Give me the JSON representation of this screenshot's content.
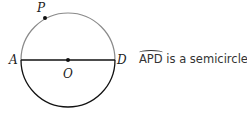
{
  "diagram": {
    "points": {
      "P": "P",
      "A": "A",
      "O": "O",
      "D": "D"
    },
    "colors": {
      "upper_arc": "#8a8a8a",
      "lower_arc": "#111111",
      "diameter": "#111111"
    }
  },
  "caption": {
    "arc_name": "APD",
    "text": " is a semicircle."
  }
}
